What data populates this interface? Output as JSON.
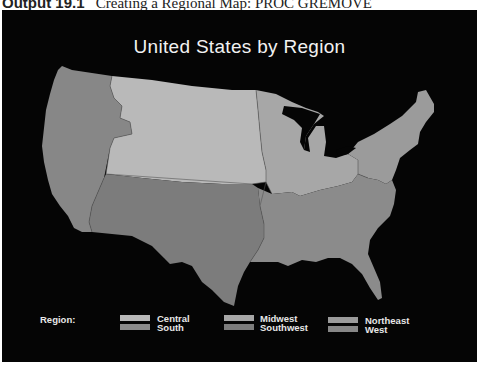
{
  "caption": {
    "label": "Output 19.1",
    "text": "Creating a Regional Map: PROC GREMOVE"
  },
  "map": {
    "title": "United States by Region",
    "background": "#050505",
    "regions": [
      {
        "name": "West",
        "color": "#878787"
      },
      {
        "name": "Central",
        "color": "#b9b9b9"
      },
      {
        "name": "Midwest",
        "color": "#a7a7a7"
      },
      {
        "name": "Northeast",
        "color": "#9b9b9b"
      },
      {
        "name": "Southwest",
        "color": "#7c7c7c"
      },
      {
        "name": "South",
        "color": "#8b8b8b"
      }
    ]
  },
  "legend": {
    "title": "Region:",
    "items": [
      {
        "label": "Central",
        "color": "#b9b9b9"
      },
      {
        "label": "South",
        "color": "#8b8b8b"
      },
      {
        "label": "Midwest",
        "color": "#a7a7a7"
      },
      {
        "label": "Southwest",
        "color": "#7c7c7c"
      },
      {
        "label": "Northeast",
        "color": "#9b9b9b"
      },
      {
        "label": "West",
        "color": "#878787"
      }
    ]
  }
}
